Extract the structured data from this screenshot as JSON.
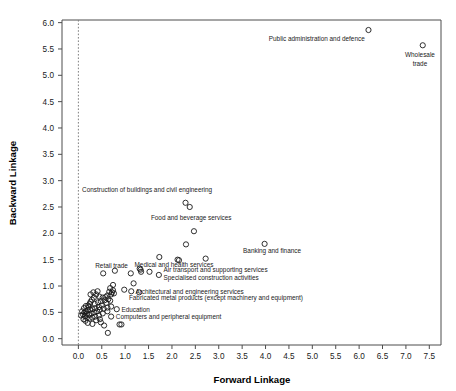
{
  "chart_data": {
    "type": "scatter",
    "title": "",
    "xlabel": "Forward Linkage",
    "ylabel": "Backward Linkage",
    "xlim": [
      -0.35,
      7.75
    ],
    "ylim": [
      -0.12,
      6.05
    ],
    "xticks": [
      "0.0",
      "0.5",
      "1.0",
      "1.5",
      "2.0",
      "2.5",
      "3.0",
      "3.5",
      "4.0",
      "4.5",
      "5.0",
      "5.5",
      "6.0",
      "6.5",
      "7.0",
      "7.5"
    ],
    "xtick_values": [
      0.0,
      0.5,
      1.0,
      1.5,
      2.0,
      2.5,
      3.0,
      3.5,
      4.0,
      4.5,
      5.0,
      5.5,
      6.0,
      6.5,
      7.0,
      7.5
    ],
    "yticks": [
      "0.0",
      "0.5",
      "1.0",
      "1.5",
      "2.0",
      "2.5",
      "3.0",
      "3.5",
      "4.0",
      "4.5",
      "5.0",
      "5.5",
      "6.0"
    ],
    "ytick_values": [
      0.0,
      0.5,
      1.0,
      1.5,
      2.0,
      2.5,
      3.0,
      3.5,
      4.0,
      4.5,
      5.0,
      5.5,
      6.0
    ],
    "grid": false,
    "legend": "none",
    "marker": "open-circle",
    "reference_lines": [
      {
        "orientation": "vertical",
        "x": 0.0,
        "style": "dotted",
        "color": "#808080"
      }
    ],
    "points": [
      {
        "x": 6.2,
        "y": 5.86,
        "label": "Public administration and defence"
      },
      {
        "x": 7.36,
        "y": 5.57,
        "label": "Wholesale trade"
      },
      {
        "x": 2.29,
        "y": 2.58,
        "label": "Construction of buildings and civil engineering"
      },
      {
        "x": 2.38,
        "y": 2.5,
        "label": "Food and beverage services"
      },
      {
        "x": 2.47,
        "y": 2.04,
        "label": ""
      },
      {
        "x": 3.98,
        "y": 1.8,
        "label": "Banking and finance"
      },
      {
        "x": 2.3,
        "y": 1.79,
        "label": ""
      },
      {
        "x": 1.73,
        "y": 1.55,
        "label": "Medical and health services"
      },
      {
        "x": 2.12,
        "y": 1.5,
        "label": "Air transport and supporting services"
      },
      {
        "x": 2.15,
        "y": 1.49,
        "label": ""
      },
      {
        "x": 2.72,
        "y": 1.52,
        "label": ""
      },
      {
        "x": 0.53,
        "y": 1.24,
        "label": "Retail trade"
      },
      {
        "x": 0.78,
        "y": 1.29,
        "label": ""
      },
      {
        "x": 1.31,
        "y": 1.33,
        "label": ""
      },
      {
        "x": 1.33,
        "y": 1.31,
        "label": ""
      },
      {
        "x": 1.34,
        "y": 1.27,
        "label": ""
      },
      {
        "x": 1.52,
        "y": 1.27,
        "label": "Specialised construction activities"
      },
      {
        "x": 1.72,
        "y": 1.21,
        "label": ""
      },
      {
        "x": 1.12,
        "y": 1.24,
        "label": ""
      },
      {
        "x": 1.18,
        "y": 1.05,
        "label": ""
      },
      {
        "x": 0.74,
        "y": 1.02,
        "label": ""
      },
      {
        "x": 0.68,
        "y": 0.96,
        "label": ""
      },
      {
        "x": 0.98,
        "y": 0.93,
        "label": ""
      },
      {
        "x": 1.13,
        "y": 0.9,
        "label": "Architectural and engineering services"
      },
      {
        "x": 1.3,
        "y": 0.88,
        "label": "Fabricated metal products (except machinery and equipment)"
      },
      {
        "x": 0.72,
        "y": 0.88,
        "label": ""
      },
      {
        "x": 0.76,
        "y": 0.86,
        "label": ""
      },
      {
        "x": 0.7,
        "y": 0.84,
        "label": ""
      },
      {
        "x": 0.62,
        "y": 0.82,
        "label": ""
      },
      {
        "x": 0.58,
        "y": 0.79,
        "label": ""
      },
      {
        "x": 0.52,
        "y": 0.78,
        "label": ""
      },
      {
        "x": 0.45,
        "y": 0.8,
        "label": ""
      },
      {
        "x": 0.38,
        "y": 0.84,
        "label": ""
      },
      {
        "x": 0.33,
        "y": 0.78,
        "label": ""
      },
      {
        "x": 0.29,
        "y": 0.74,
        "label": ""
      },
      {
        "x": 0.26,
        "y": 0.7,
        "label": ""
      },
      {
        "x": 0.24,
        "y": 0.66,
        "label": ""
      },
      {
        "x": 0.21,
        "y": 0.63,
        "label": ""
      },
      {
        "x": 0.35,
        "y": 0.66,
        "label": ""
      },
      {
        "x": 0.42,
        "y": 0.69,
        "label": ""
      },
      {
        "x": 0.48,
        "y": 0.71,
        "label": ""
      },
      {
        "x": 0.56,
        "y": 0.73,
        "label": ""
      },
      {
        "x": 0.64,
        "y": 0.75,
        "label": ""
      },
      {
        "x": 0.68,
        "y": 0.72,
        "label": ""
      },
      {
        "x": 0.6,
        "y": 0.68,
        "label": ""
      },
      {
        "x": 0.5,
        "y": 0.63,
        "label": ""
      },
      {
        "x": 0.44,
        "y": 0.6,
        "label": ""
      },
      {
        "x": 0.36,
        "y": 0.58,
        "label": ""
      },
      {
        "x": 0.3,
        "y": 0.56,
        "label": ""
      },
      {
        "x": 0.25,
        "y": 0.55,
        "label": ""
      },
      {
        "x": 0.2,
        "y": 0.54,
        "label": ""
      },
      {
        "x": 0.16,
        "y": 0.52,
        "label": ""
      },
      {
        "x": 0.13,
        "y": 0.5,
        "label": ""
      },
      {
        "x": 0.18,
        "y": 0.47,
        "label": ""
      },
      {
        "x": 0.23,
        "y": 0.45,
        "label": ""
      },
      {
        "x": 0.28,
        "y": 0.48,
        "label": ""
      },
      {
        "x": 0.34,
        "y": 0.5,
        "label": ""
      },
      {
        "x": 0.4,
        "y": 0.52,
        "label": ""
      },
      {
        "x": 0.46,
        "y": 0.55,
        "label": ""
      },
      {
        "x": 0.54,
        "y": 0.57,
        "label": ""
      },
      {
        "x": 0.62,
        "y": 0.59,
        "label": ""
      },
      {
        "x": 0.7,
        "y": 0.61,
        "label": ""
      },
      {
        "x": 0.82,
        "y": 0.56,
        "label": "Education"
      },
      {
        "x": 0.62,
        "y": 0.52,
        "label": ""
      },
      {
        "x": 0.52,
        "y": 0.48,
        "label": ""
      },
      {
        "x": 0.44,
        "y": 0.44,
        "label": ""
      },
      {
        "x": 0.36,
        "y": 0.42,
        "label": ""
      },
      {
        "x": 0.3,
        "y": 0.4,
        "label": ""
      },
      {
        "x": 0.24,
        "y": 0.38,
        "label": ""
      },
      {
        "x": 0.18,
        "y": 0.4,
        "label": ""
      },
      {
        "x": 0.14,
        "y": 0.43,
        "label": ""
      },
      {
        "x": 0.1,
        "y": 0.46,
        "label": ""
      },
      {
        "x": 0.12,
        "y": 0.58,
        "label": ""
      },
      {
        "x": 0.16,
        "y": 0.62,
        "label": ""
      },
      {
        "x": 0.22,
        "y": 0.6,
        "label": ""
      },
      {
        "x": 0.26,
        "y": 0.84,
        "label": ""
      },
      {
        "x": 0.32,
        "y": 0.88,
        "label": ""
      },
      {
        "x": 0.41,
        "y": 0.9,
        "label": ""
      },
      {
        "x": 0.66,
        "y": 0.89,
        "label": ""
      },
      {
        "x": 0.74,
        "y": 0.92,
        "label": ""
      },
      {
        "x": 0.7,
        "y": 0.42,
        "label": "Computers and peripheral equipment"
      },
      {
        "x": 0.48,
        "y": 0.31,
        "label": ""
      },
      {
        "x": 0.3,
        "y": 0.28,
        "label": ""
      },
      {
        "x": 0.55,
        "y": 0.25,
        "label": ""
      },
      {
        "x": 0.88,
        "y": 0.27,
        "label": ""
      },
      {
        "x": 0.92,
        "y": 0.27,
        "label": ""
      },
      {
        "x": 0.63,
        "y": 0.11,
        "label": ""
      },
      {
        "x": 0.2,
        "y": 0.3,
        "label": ""
      },
      {
        "x": 0.15,
        "y": 0.34,
        "label": ""
      },
      {
        "x": 0.11,
        "y": 0.37,
        "label": ""
      },
      {
        "x": 0.08,
        "y": 0.52,
        "label": ""
      },
      {
        "x": 0.06,
        "y": 0.44,
        "label": ""
      },
      {
        "x": 0.38,
        "y": 0.35,
        "label": ""
      },
      {
        "x": 0.46,
        "y": 0.37,
        "label": ""
      }
    ],
    "annotations": [
      {
        "text": "Public administration and defence",
        "x": 6.12,
        "y": 5.66,
        "anchor": "end"
      },
      {
        "text": "Wholesale trade",
        "x": 7.3,
        "y": 5.34,
        "anchor": "middle",
        "lines": [
          "Wholesale",
          "trade"
        ]
      },
      {
        "text": "Construction of buildings and civil engineering",
        "x": 0.08,
        "y": 2.78,
        "anchor": "start"
      },
      {
        "text": "Food and beverage services",
        "x": 1.55,
        "y": 2.26,
        "anchor": "start"
      },
      {
        "text": "Banking and finance",
        "x": 3.52,
        "y": 1.62,
        "anchor": "start"
      },
      {
        "text": "Medical and health services",
        "x": 1.2,
        "y": 1.37,
        "anchor": "start"
      },
      {
        "text": "Retail trade",
        "x": 0.36,
        "y": 1.35,
        "anchor": "start"
      },
      {
        "text": "Air transport and supporting services",
        "x": 1.82,
        "y": 1.26,
        "anchor": "start"
      },
      {
        "text": "Specialised construction activities",
        "x": 1.82,
        "y": 1.12,
        "anchor": "start"
      },
      {
        "text": "Architectural and engineering services",
        "x": 1.22,
        "y": 0.84,
        "anchor": "start"
      },
      {
        "text": "Fabricated metal products (except machinery and equipment)",
        "x": 1.08,
        "y": 0.73,
        "anchor": "start"
      },
      {
        "text": "Education",
        "x": 0.92,
        "y": 0.51,
        "anchor": "start"
      },
      {
        "text": "Computers and peripheral equipment",
        "x": 0.8,
        "y": 0.37,
        "anchor": "start"
      }
    ]
  }
}
